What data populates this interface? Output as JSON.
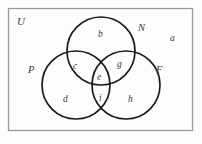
{
  "figure": {
    "type": "venn-diagram-3-set",
    "universal_set_label": "U",
    "background_color": "#fdfdfd",
    "stroke_color": "#1a1a1a",
    "label_color": "#3a3a3a",
    "frame_color": "#9a9a9a"
  },
  "sets": [
    {
      "id": "N",
      "label": "N",
      "position": "top"
    },
    {
      "id": "P",
      "label": "P",
      "position": "bottom-left"
    },
    {
      "id": "F",
      "label": "F",
      "position": "bottom-right"
    }
  ],
  "regions": [
    {
      "id": "a",
      "label": "a",
      "meaning": "outside-all-circles"
    },
    {
      "id": "b",
      "label": "b",
      "meaning": "N-only"
    },
    {
      "id": "c",
      "label": "c",
      "meaning": "N-and-P"
    },
    {
      "id": "g",
      "label": "g",
      "meaning": "N-and-F"
    },
    {
      "id": "e",
      "label": "e",
      "meaning": "N-and-P-and-F"
    },
    {
      "id": "d",
      "label": "d",
      "meaning": "P-only"
    },
    {
      "id": "i",
      "label": "i",
      "meaning": "P-and-F"
    },
    {
      "id": "h",
      "label": "h",
      "meaning": "F-only"
    }
  ]
}
